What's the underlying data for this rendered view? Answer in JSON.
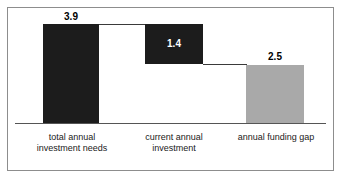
{
  "chart_data": {
    "type": "bar",
    "subtype": "waterfall",
    "title": "",
    "xlabel": "",
    "ylabel": "",
    "ylim": [
      0,
      3.9
    ],
    "grid": false,
    "legend": null,
    "categories": [
      "total annual\ninvestment needs",
      "current annual\ninvestment",
      "annual funding gap"
    ],
    "values": [
      3.9,
      1.4,
      2.5
    ],
    "value_labels": [
      "3.9",
      "2.5",
      "1.4"
    ],
    "bars": [
      {
        "category": "total annual\ninvestment needs",
        "value": 3.9,
        "label": "3.9",
        "color": "#1c1c1c",
        "label_color": "#000000",
        "label_position": "outside-top",
        "base": 0,
        "top": 3.9
      },
      {
        "category": "current annual\ninvestment",
        "value": 1.4,
        "label": "1.4",
        "color": "#1c1c1c",
        "label_color": "#ffffff",
        "label_position": "inside",
        "base": 2.5,
        "top": 3.9
      },
      {
        "category": "annual funding gap",
        "value": 2.5,
        "label": "2.5",
        "color": "#a9a9a9",
        "label_color": "#000000",
        "label_position": "outside-top",
        "base": 0,
        "top": 2.5
      }
    ],
    "colors": {
      "dark_bar": "#1c1c1c",
      "light_bar": "#a9a9a9",
      "axis": "#555555",
      "connector": "#3a3a3a",
      "frame": "#8d8d8d",
      "background": "#ffffff"
    },
    "connectors": [
      {
        "from": "total annual investment needs",
        "to": "current annual investment",
        "at_value": 3.9
      },
      {
        "from": "current annual investment",
        "to": "annual funding gap",
        "at_value": 2.5
      }
    ]
  }
}
